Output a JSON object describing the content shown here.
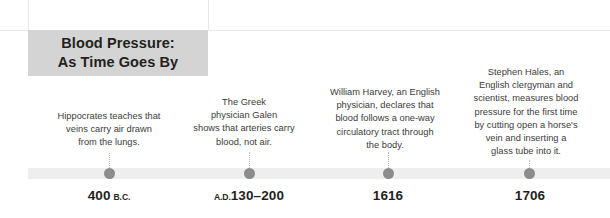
{
  "title": {
    "text": "Blood Pressure:\nAs Time Goes By",
    "background_color": "#d4d4d4",
    "text_color": "#231f20"
  },
  "timeline": {
    "bar_color": "#eeeeee",
    "dot_color": "#8c8c8c",
    "connector_color": "#bdbdbd"
  },
  "events": [
    {
      "caption": "Hippocrates teaches that\nveins carry air drawn\nfrom the lungs.",
      "era": "B.C.",
      "era_position": "after",
      "year": "400",
      "date_display": "400 B.C."
    },
    {
      "caption": "The Greek\nphysician Galen\nshows that arteries carry\nblood, not air.",
      "era": "A.D.",
      "era_position": "before",
      "year": "130–200",
      "date_display": "A.D.130–200"
    },
    {
      "caption": "William Harvey, an English\nphysician, declares that\nblood follows a one-way\ncirculatory tract through\nthe body.",
      "era": "",
      "era_position": "none",
      "year": "1616",
      "date_display": "1616"
    },
    {
      "caption": "Stephen Hales, an\nEnglish clergyman and\nscientist, measures blood\npressure for the first time\nby cutting open a horse's\nvein and inserting a\nglass tube into it.",
      "era": "",
      "era_position": "none",
      "year": "1706",
      "date_display": "1706"
    }
  ]
}
